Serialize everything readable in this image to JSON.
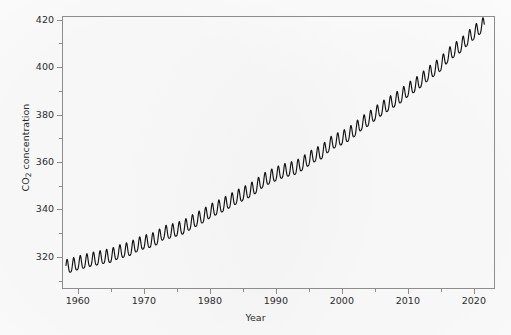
{
  "chart_data": {
    "type": "line",
    "title": "",
    "xlabel": "Year",
    "ylabel_text": "CO",
    "ylabel_sub": "2",
    "ylabel_rest": " concentration",
    "ylabel_full": "CO2 concentration",
    "xlim": [
      1957.6,
      2023.2
    ],
    "ylim": [
      306.5,
      421.5
    ],
    "x_major_ticks": [
      1960,
      1970,
      1980,
      1990,
      2000,
      2010,
      2020
    ],
    "x_minor_ticks": [
      1965,
      1975,
      1985,
      1995,
      2005,
      2015
    ],
    "x_tick_labels": [
      "1960",
      "1970",
      "1980",
      "1990",
      "2000",
      "2010",
      "2020"
    ],
    "y_major_ticks": [
      320,
      340,
      360,
      380,
      400,
      420
    ],
    "y_minor_ticks": [
      310,
      330,
      350,
      370,
      390,
      410
    ],
    "y_tick_labels": [
      "320",
      "340",
      "360",
      "380",
      "400",
      "420"
    ],
    "grid": false,
    "legend": null,
    "line_color": "#111111",
    "line_width": 1.2,
    "axis_color": "#8d8d8d",
    "background_color": "#fbfbfb",
    "series": [
      {
        "name": "Monthly mean CO2 (Mauna Loa)",
        "seasonal_amplitude_ppm": 6.2,
        "annual_mean": {
          "x": [
            1958,
            1959,
            1960,
            1961,
            1962,
            1963,
            1964,
            1965,
            1966,
            1967,
            1968,
            1969,
            1970,
            1971,
            1972,
            1973,
            1974,
            1975,
            1976,
            1977,
            1979,
            1980,
            1981,
            1982,
            1983,
            1984,
            1985,
            1986,
            1987,
            1988,
            1989,
            1990,
            1991,
            1992,
            1993,
            1994,
            1995,
            1996,
            1997,
            1998,
            1999,
            2000,
            2001,
            2002,
            2003,
            2004,
            2005,
            2006,
            2007,
            2008,
            2009,
            2010,
            2011,
            2012,
            2013,
            2014,
            2015,
            2016,
            2017,
            2018,
            2019,
            2020,
            2021
          ],
          "y": [
            315.3,
            315.9,
            316.9,
            317.6,
            318.4,
            318.9,
            319.6,
            320.0,
            321.4,
            322.2,
            323.0,
            324.6,
            325.7,
            326.3,
            327.5,
            329.7,
            330.2,
            331.1,
            332.0,
            333.8,
            336.8,
            338.7,
            340.1,
            341.4,
            343.0,
            344.6,
            346.0,
            347.4,
            349.2,
            351.6,
            353.1,
            354.4,
            355.6,
            356.4,
            357.1,
            358.8,
            360.8,
            362.6,
            363.7,
            366.7,
            368.4,
            369.6,
            371.1,
            373.2,
            375.8,
            377.5,
            379.8,
            381.9,
            383.8,
            385.6,
            387.4,
            389.9,
            391.7,
            393.9,
            396.5,
            398.6,
            400.8,
            404.2,
            406.6,
            408.5,
            411.4,
            414.0,
            416.4
          ]
        }
      }
    ],
    "annotations": []
  },
  "axes": {
    "x_axis_name": "year-axis",
    "y_axis_name": "co2-concentration-axis"
  }
}
